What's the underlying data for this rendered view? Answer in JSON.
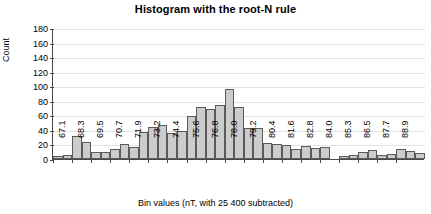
{
  "chart_data": {
    "type": "bar",
    "title": "Histogram with the root-N rule",
    "xlabel": "Bin values (nT, with 25 400 subtracted)",
    "ylabel": "Count",
    "ylim": [
      0,
      180
    ],
    "yticks": [
      0,
      20,
      40,
      60,
      80,
      100,
      120,
      140,
      160,
      180
    ],
    "grid": true,
    "legend": "none",
    "xtick_labels": [
      "67.1",
      "68.3",
      "69.5",
      "70.7",
      "71.9",
      "73.2",
      "74.4",
      "75.6",
      "76.8",
      "78.0",
      "79.2",
      "80.4",
      "81.6",
      "82.8",
      "84.0",
      "85.3",
      "86.5",
      "87.7",
      "88.9"
    ],
    "xtick_bin_index": [
      0,
      2,
      4,
      6,
      8,
      10,
      12,
      14,
      16,
      18,
      20,
      22,
      24,
      26,
      28,
      30,
      32,
      34,
      36
    ],
    "categories": [
      "67.1",
      "67.7",
      "68.3",
      "68.9",
      "69.5",
      "70.1",
      "70.7",
      "71.3",
      "71.9",
      "72.5",
      "73.2",
      "73.8",
      "74.4",
      "75.0",
      "75.6",
      "76.2",
      "76.8",
      "77.4",
      "78.0",
      "78.6",
      "79.2",
      "79.8",
      "80.4",
      "81.0",
      "81.6",
      "82.2",
      "82.8",
      "83.4",
      "84.0",
      "84.6",
      "85.3",
      "85.9",
      "86.5",
      "87.1",
      "87.7",
      "88.3",
      "88.9",
      "89.5",
      "90.1"
    ],
    "values": [
      4,
      6,
      31,
      23,
      10,
      9,
      14,
      20,
      16,
      37,
      44,
      47,
      36,
      38,
      59,
      72,
      69,
      74,
      96,
      71,
      43,
      43,
      22,
      20,
      19,
      14,
      18,
      15,
      17,
      0,
      4,
      6,
      9,
      13,
      5,
      7,
      14,
      11,
      8
    ],
    "bar_fill": "#cccccc",
    "bar_edge": "#5a5a5a",
    "grid_color": "#e2e2e2",
    "axis_color": "#4a4a4a"
  }
}
